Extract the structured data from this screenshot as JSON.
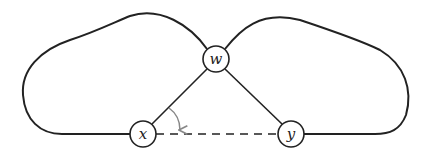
{
  "diagram": {
    "nodes": [
      {
        "id": "w",
        "label": "w",
        "cx": 216,
        "cy": 59,
        "r": 13
      },
      {
        "id": "x",
        "label": "x",
        "cx": 143,
        "cy": 134,
        "r": 13
      },
      {
        "id": "y",
        "label": "y",
        "cx": 291,
        "cy": 134,
        "r": 13
      }
    ],
    "edges": [
      {
        "from": "w",
        "to": "x",
        "style": "solid"
      },
      {
        "from": "w",
        "to": "y",
        "style": "solid"
      },
      {
        "from": "x",
        "to": "y",
        "style": "dashed"
      },
      {
        "from": "x",
        "to": "w",
        "style": "solid",
        "shape": "left-loop"
      },
      {
        "from": "w",
        "to": "y",
        "style": "solid",
        "shape": "right-loop"
      }
    ],
    "annotations": [
      {
        "type": "rotation-arrow",
        "from_edge": "w-x",
        "to_edge": "x-y",
        "color": "#888888"
      }
    ],
    "colors": {
      "stroke": "#222222",
      "arrow": "#888888",
      "background": "#ffffff"
    }
  }
}
